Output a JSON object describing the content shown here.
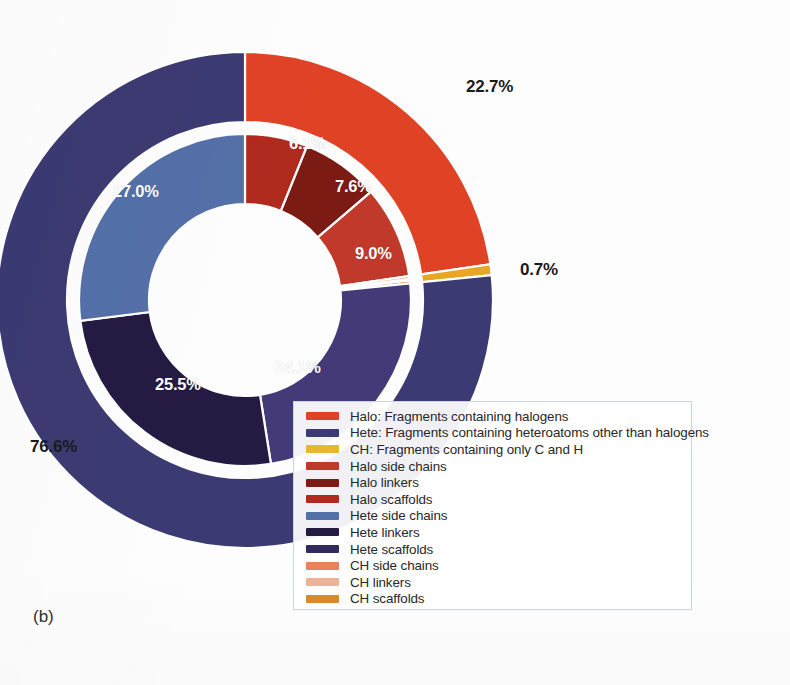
{
  "panel": {
    "tag": "(b)"
  },
  "chart_data": {
    "type": "pie",
    "variant": "nested-donut",
    "title": "",
    "subtitle": "",
    "xlabel": "",
    "ylabel": "",
    "grid": false,
    "legend_position": "bottom-right-overlay",
    "start_angle_deg": 0,
    "direction": "clockwise",
    "rings": [
      {
        "name": "outer",
        "inner_radius_px": 178,
        "outer_radius_px": 248,
        "slices": [
          {
            "label": "Halo",
            "value": 22.7,
            "display": "22.7%",
            "color": "#e04226",
            "label_shown": true
          },
          {
            "label": "CH",
            "value": 0.7,
            "display": "0.7%",
            "color": "#e8a723",
            "label_shown": true
          },
          {
            "label": "Hete",
            "value": 76.6,
            "display": "76.6%",
            "color": "#3c3a72",
            "label_shown": true
          }
        ]
      },
      {
        "name": "inner",
        "inner_radius_px": 96,
        "outer_radius_px": 166,
        "slices": [
          {
            "label": "Halo side chains",
            "value": 6.1,
            "display": "6.1%",
            "color": "#b02a1e",
            "label_shown": true
          },
          {
            "label": "Halo linkers",
            "value": 7.6,
            "display": "7.6%",
            "color": "#7c1a14",
            "label_shown": true
          },
          {
            "label": "Halo scaffolds",
            "value": 9.0,
            "display": "9.0%",
            "color": "#c0392b",
            "label_shown": true
          },
          {
            "label": "CH side chains",
            "value": 0.28,
            "display": "",
            "color": "#e8825a",
            "label_shown": false
          },
          {
            "label": "CH linkers",
            "value": 0.14,
            "display": "",
            "color": "#efb295",
            "label_shown": false
          },
          {
            "label": "CH scaffolds",
            "value": 0.28,
            "display": "",
            "color": "#d98a2b",
            "label_shown": false
          },
          {
            "label": "Hete scaffolds",
            "value": 24.1,
            "display": "24.1%",
            "color": "#453a78",
            "label_shown": true
          },
          {
            "label": "Hete linkers",
            "value": 25.5,
            "display": "25.5%",
            "color": "#241a42",
            "label_shown": true
          },
          {
            "label": "Hete side chains",
            "value": 27.0,
            "display": "27.0%",
            "color": "#5470a8",
            "label_shown": true
          }
        ]
      }
    ],
    "outer_labels": [
      {
        "text": "22.7%",
        "x": 466,
        "y": 77
      },
      {
        "text": "0.7%",
        "x": 520,
        "y": 260
      },
      {
        "text": "76.6%",
        "x": 30,
        "y": 437
      }
    ],
    "inner_labels": [
      {
        "text": "6.1%",
        "x": 289,
        "y": 134
      },
      {
        "text": "7.6%",
        "x": 335,
        "y": 177
      },
      {
        "text": "9.0%",
        "x": 355,
        "y": 244
      },
      {
        "text": "24.1%",
        "x": 275,
        "y": 358
      },
      {
        "text": "25.5%",
        "x": 155,
        "y": 375
      },
      {
        "text": "27.0%",
        "x": 113,
        "y": 182
      }
    ]
  },
  "legend": {
    "items": [
      {
        "label": "Halo: Fragments containing halogens",
        "color": "#e04226"
      },
      {
        "label": "Hete: Fragments containing heteroatoms other than halogens",
        "color": "#3c3a72"
      },
      {
        "label": "CH: Fragments containing only C and H",
        "color": "#e8b732"
      },
      {
        "label": "Halo side chains",
        "color": "#c0392b"
      },
      {
        "label": "Halo linkers",
        "color": "#7c1a14"
      },
      {
        "label": "Halo scaffolds",
        "color": "#b02a1e"
      },
      {
        "label": "Hete side chains",
        "color": "#5470a8"
      },
      {
        "label": "Hete linkers",
        "color": "#241a42"
      },
      {
        "label": "Hete scaffolds",
        "color": "#332b5e"
      },
      {
        "label": "CH side chains",
        "color": "#e8825a"
      },
      {
        "label": "CH linkers",
        "color": "#efb295"
      },
      {
        "label": "CH scaffolds",
        "color": "#d98a2b"
      }
    ]
  }
}
